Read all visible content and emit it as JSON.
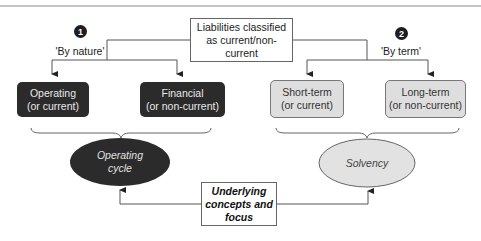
{
  "diagram": {
    "root": {
      "label": "Liabilities classified as current/non-current"
    },
    "branches": [
      {
        "number": "1",
        "label": "'By nature'",
        "children": [
          {
            "line1": "Operating",
            "line2": "(or current)"
          },
          {
            "line1": "Financial",
            "line2": "(or non-current)"
          }
        ],
        "concept": {
          "line1": "Operating",
          "line2": "cycle"
        }
      },
      {
        "number": "2",
        "label": "'By term'",
        "children": [
          {
            "line1": "Short-term",
            "line2": "(or current)"
          },
          {
            "line1": "Long-term",
            "line2": "(or non-current)"
          }
        ],
        "concept": {
          "line1": "Solvency"
        }
      }
    ],
    "bottom": {
      "line1": "Underlying",
      "line2": "concepts and",
      "line3": "focus"
    },
    "colors": {
      "dark_fill": "#2b2b2b",
      "light_fill": "#dedede",
      "line": "#555555"
    }
  }
}
